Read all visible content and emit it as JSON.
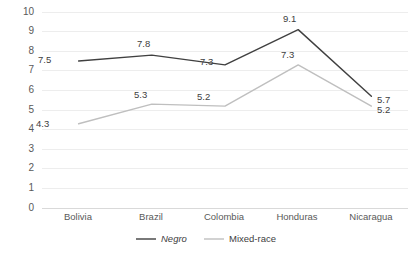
{
  "chart_data": {
    "type": "line",
    "title": "",
    "xlabel": "",
    "ylabel": "",
    "categories": [
      "Bolivia",
      "Brazil",
      "Colombia",
      "Honduras",
      "Nicaragua"
    ],
    "series": [
      {
        "name": "Negro",
        "color": "#404040",
        "style": "italic",
        "values": [
          7.5,
          7.8,
          7.3,
          9.1,
          5.7
        ],
        "labels": [
          "7.5",
          "7.8",
          "7.3",
          "9.1",
          "5.7"
        ]
      },
      {
        "name": "Mixed-race",
        "color": "#bfbfbf",
        "style": "normal",
        "values": [
          4.3,
          5.3,
          5.2,
          7.3,
          5.2
        ],
        "labels": [
          "4.3",
          "5.3",
          "5.2",
          "7.3",
          "5.2"
        ]
      }
    ],
    "ylim": [
      0,
      10
    ],
    "yticks": [
      10,
      9,
      8,
      7,
      6,
      5,
      4,
      3,
      2,
      1,
      0
    ],
    "ytick_labels": [
      "10",
      "9",
      "8",
      "7",
      "6",
      "5",
      "4",
      "3",
      "2",
      "1",
      "0"
    ],
    "grid": true,
    "grid_color": "#ededed",
    "legend_position": "bottom",
    "background": "#ffffff"
  },
  "axis": {
    "y_labels": [
      "10",
      "9",
      "8",
      "7",
      "6",
      "5",
      "4",
      "3",
      "2",
      "1",
      "0"
    ],
    "x_labels": [
      "Bolivia",
      "Brazil",
      "Colombia",
      "Honduras",
      "Nicaragua"
    ]
  },
  "legend": {
    "items": [
      {
        "label": "Negro",
        "color": "#404040"
      },
      {
        "label": "Mixed-race",
        "color": "#bfbfbf"
      }
    ]
  },
  "labels": {
    "negro": [
      "7.5",
      "7.8",
      "7.3",
      "9.1",
      "5.7"
    ],
    "mixed": [
      "4.3",
      "5.3",
      "5.2",
      "7.3",
      "5.2"
    ]
  }
}
